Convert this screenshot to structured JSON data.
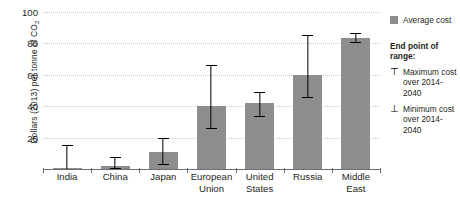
{
  "chart_data": {
    "type": "bar",
    "title": "",
    "xlabel": "",
    "ylabel": "Dollars (2013) per tonne of CO2",
    "ylim": [
      0,
      100
    ],
    "yticks": [
      0,
      20,
      40,
      60,
      80,
      100
    ],
    "ytick_labels": [
      "",
      "20",
      "40",
      "60",
      "80",
      "100"
    ],
    "grid": true,
    "legend_position": "right",
    "categories": [
      "India",
      "China",
      "Japan",
      "European Union",
      "United States",
      "Russia",
      "Middle East"
    ],
    "category_lines": [
      [
        "India"
      ],
      [
        "China"
      ],
      [
        "Japan"
      ],
      [
        "European",
        "Union"
      ],
      [
        "United",
        "States"
      ],
      [
        "Russia"
      ],
      [
        "Middle",
        "East"
      ]
    ],
    "series": [
      {
        "name": "Average cost",
        "values": [
          0.3,
          2,
          11,
          40,
          42,
          60,
          83.5
        ]
      }
    ],
    "error_bars": {
      "max_label": "Maximum cost over 2014-2040",
      "min_label": "Minimum cost over 2014-2040",
      "max": [
        15,
        7.5,
        19.5,
        66,
        49,
        85.5,
        86.5
      ],
      "min": [
        0,
        0.5,
        3,
        26,
        33.5,
        46,
        81
      ]
    },
    "colors": {
      "bar": "#8d8d8d",
      "error_bar": "#000000",
      "gridline": "#c9c9c9",
      "axis": "#6d6e71",
      "text": "#231f20",
      "background": "#ffffff"
    }
  },
  "yaxis": {
    "title_main": "Dollars (2013) per tonne of CO",
    "title_sub": "2"
  },
  "legend": {
    "average_label": "Average cost",
    "range_heading": "End point of range:",
    "max_glyph": "⊤",
    "min_glyph": "⊥",
    "max_line1": "Maximum cost",
    "max_line2": "over 2014-2040",
    "min_line1": "Minimum cost",
    "min_line2": "over 2014-2040"
  }
}
